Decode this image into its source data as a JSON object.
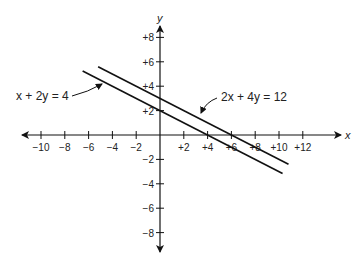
{
  "chart_data": {
    "type": "line",
    "title": "",
    "xlabel": "x",
    "ylabel": "y",
    "xlim": [
      -11.5,
      15
    ],
    "ylim": [
      -9.5,
      9
    ],
    "grid": false,
    "x_ticks": [
      -10,
      -8,
      -6,
      -4,
      -2,
      2,
      4,
      6,
      8,
      10,
      12
    ],
    "x_tick_labels": [
      "−10",
      "−8",
      "−6",
      "−4",
      "−2",
      "+2",
      "+4",
      "+6",
      "+8",
      "+10",
      "+12"
    ],
    "y_ticks": [
      8,
      6,
      4,
      2,
      -2,
      -4,
      -6,
      -8
    ],
    "y_tick_labels": [
      "+8",
      "+6",
      "+4",
      "+2",
      "−2",
      "−4",
      "−6",
      "−8"
    ],
    "series": [
      {
        "name": "x + 2y = 4",
        "equation": "x + 2y = 4",
        "x": [
          -6.5,
          10.3
        ],
        "y": [
          5.25,
          -3.15
        ]
      },
      {
        "name": "2x + 4y = 12",
        "equation": "2x + 4y = 12",
        "x": [
          -5.2,
          10.8
        ],
        "y": [
          5.6,
          -2.4
        ]
      }
    ],
    "annotations": [
      {
        "text": "x + 2y = 4",
        "points_to": "inner line"
      },
      {
        "text": "2x + 4y = 12",
        "points_to": "outer line"
      }
    ]
  },
  "labels": {
    "x_axis": "x",
    "y_axis": "y",
    "eq1": "x + 2y = 4",
    "eq2": "2x + 4y = 12"
  }
}
